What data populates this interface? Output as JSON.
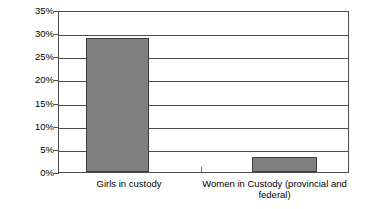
{
  "chart_data": {
    "type": "bar",
    "title": "",
    "subtitle": "",
    "xlabel": "",
    "ylabel": "",
    "categories": [
      "Girls in custody",
      "Women in Custody (provincial and federal)"
    ],
    "values": [
      29.3,
      3.2
    ],
    "value_format": "percent",
    "ylim": [
      0,
      35
    ],
    "ytick_values": [
      0,
      5,
      10,
      15,
      20,
      25,
      30,
      35
    ],
    "ytick_labels": [
      "0%",
      "5%",
      "10%",
      "15%",
      "20%",
      "25%",
      "30%",
      "35%"
    ],
    "grid": true,
    "grid_axis": "y",
    "legend": false,
    "legend_position": "none",
    "series": [
      {
        "name": "",
        "values": [
          29.3,
          3.2
        ]
      }
    ],
    "colors": {
      "bar_fill": "#808080",
      "bar_border": "#3d3d3d",
      "gridline": "#4d4d4d",
      "axis": "#4d4d4d",
      "plot_background": "#ffffff",
      "text": "#000000"
    }
  }
}
